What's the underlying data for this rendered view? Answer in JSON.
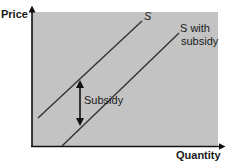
{
  "diagram": {
    "type": "supply-shift",
    "background_color": "#ffffff",
    "plot_fill": "#c3c3c3",
    "line_color": "#333333",
    "axes": {
      "y_label": "Price",
      "x_label": "Quantity"
    },
    "curves": [
      {
        "name": "S",
        "label": "S"
      },
      {
        "name": "S with subsidy",
        "label_line1": "S with",
        "label_line2": "subsidy"
      }
    ],
    "annotation": {
      "label": "Subsidy",
      "description": "vertical double-headed arrow showing the vertical distance between S and S with subsidy"
    }
  }
}
